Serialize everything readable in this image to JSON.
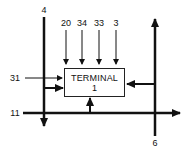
{
  "diagram": {
    "terminal": {
      "title": "TERMINAL",
      "number": "1"
    },
    "lines": {
      "line_4": "4",
      "line_6": "6",
      "line_11": "11",
      "line_31": "31"
    },
    "inputs_top": [
      "20",
      "34",
      "33",
      "3"
    ],
    "colors": {
      "stroke": "#111111",
      "background": "#ffffff"
    }
  }
}
